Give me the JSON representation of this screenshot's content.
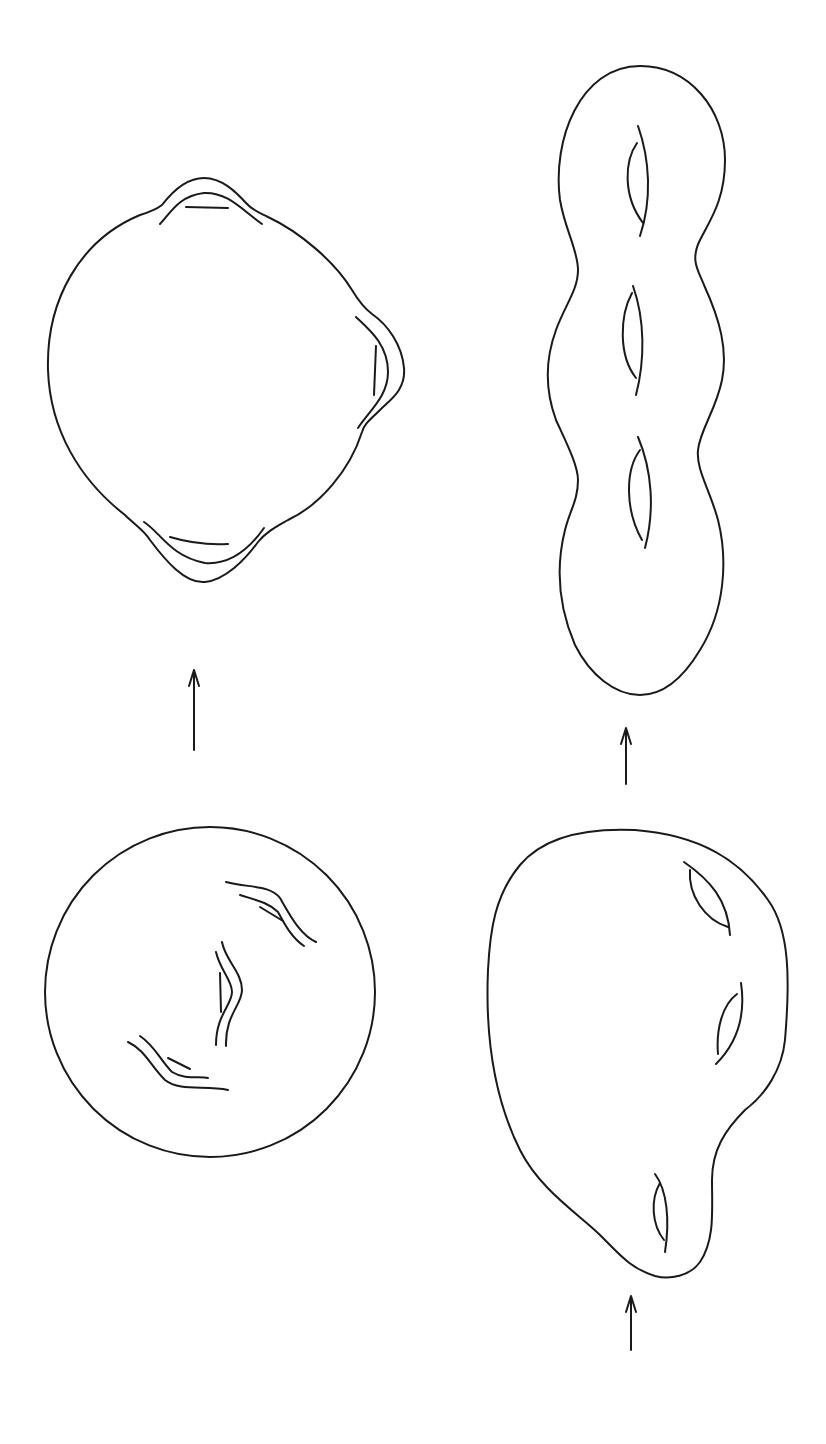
{
  "diagram": {
    "type": "topology-surface-deformation",
    "background": "#ffffff",
    "stroke_color": "#1a1a1a",
    "figures": [
      {
        "id": "sphere-three-handles-raised",
        "position": "top-left",
        "handles": 3
      },
      {
        "id": "genus-three-chain-surface",
        "position": "top-right",
        "holes": 3
      },
      {
        "id": "sphere-with-three-tubes",
        "position": "bottom-left",
        "handles": 3
      },
      {
        "id": "lumpy-genus-three-surface",
        "position": "bottom-right",
        "holes": 3
      }
    ],
    "arrows": [
      {
        "id": "arrow-bottom-left-to-top-left",
        "direction": "up"
      },
      {
        "id": "arrow-bottom-right-to-top-right",
        "direction": "up"
      },
      {
        "id": "arrow-into-bottom-right",
        "direction": "up"
      }
    ]
  }
}
